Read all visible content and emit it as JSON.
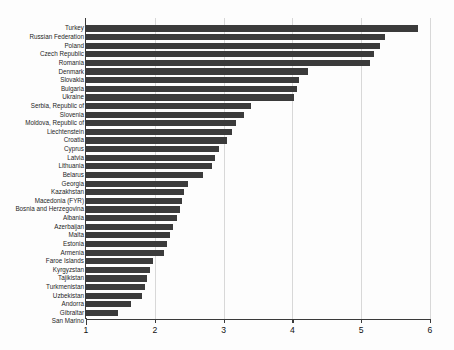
{
  "chart": {
    "type": "bar",
    "orientation": "horizontal",
    "title": "",
    "xlabel": "",
    "ylabel": "",
    "background_color": "#fdfdfd",
    "bar_color": "#3b3b3b",
    "axis_color": "#3a3a3a",
    "grid_color": "#d8d8d8",
    "grid": true,
    "legend": false
  },
  "chart_data": {
    "type": "bar",
    "title": "",
    "xlabel": "",
    "ylabel": "",
    "xlim": [
      1,
      6
    ],
    "ylim": null,
    "grid": true,
    "legend_position": "none",
    "orientation": "horizontal",
    "xticks": [
      "1",
      "2",
      "3",
      "4",
      "5",
      "6"
    ],
    "categories": [
      "Turkey",
      "Russian Federation",
      "Poland",
      "Czech Republic",
      "Romania",
      "Denmark",
      "Slovakia",
      "Bulgaria",
      "Ukraine",
      "Serbia, Republic of",
      "Slovenia",
      "Moldova, Republic of",
      "Liechtenstein",
      "Croatia",
      "Cyprus",
      "Latvia",
      "Lithuania",
      "Belarus",
      "Georgia",
      "Kazakhstan",
      "Macedonia (FYR)",
      "Bosnia and Herzegovina",
      "Albania",
      "Azerbaijan",
      "Malta",
      "Estonia",
      "Armenia",
      "Faroe Islands",
      "Kyrgyzstan",
      "Tajikistan",
      "Turkmenistan",
      "Uzbekistan",
      "Andorra",
      "Gibraltar",
      "San Marino"
    ],
    "values": [
      5.82,
      5.35,
      5.28,
      5.18,
      5.13,
      4.22,
      4.1,
      4.07,
      4.03,
      3.4,
      3.3,
      3.18,
      3.12,
      3.05,
      2.93,
      2.88,
      2.83,
      2.7,
      2.48,
      2.43,
      2.4,
      2.36,
      2.32,
      2.27,
      2.22,
      2.18,
      2.13,
      1.97,
      1.93,
      1.89,
      1.86,
      1.82,
      1.66,
      1.46,
      1.0
    ]
  }
}
